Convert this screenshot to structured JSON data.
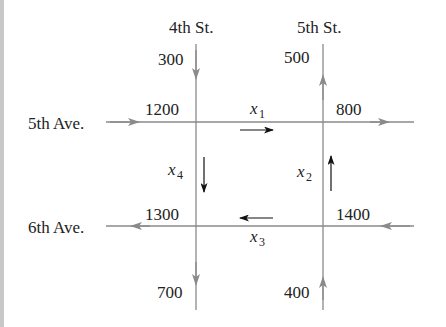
{
  "diagram": {
    "colors": {
      "street": "#8a8a8a",
      "flow_arrow": "#111111",
      "text": "#222222",
      "strip": "#c8c8c8"
    },
    "streets": {
      "vertical": [
        {
          "name": "4th St.",
          "x": 196
        },
        {
          "name": "5th St.",
          "x": 323
        }
      ],
      "horizontal": [
        {
          "name": "5th Ave.",
          "y": 122
        },
        {
          "name": "6th Ave.",
          "y": 226
        }
      ]
    },
    "external_flows": {
      "4th_st_in": "300",
      "5th_st_out": "500",
      "5th_ave_in": "1200",
      "5th_ave_out": "800",
      "6th_ave_out": "1300",
      "6th_ave_in": "1400",
      "4th_st_out": "700",
      "5th_st_in": "400"
    },
    "variables": {
      "x1": {
        "base": "x",
        "sub": "1",
        "direction": "right"
      },
      "x2": {
        "base": "x",
        "sub": "2",
        "direction": "up"
      },
      "x3": {
        "base": "x",
        "sub": "3",
        "direction": "left"
      },
      "x4": {
        "base": "x",
        "sub": "4",
        "direction": "down"
      }
    }
  }
}
